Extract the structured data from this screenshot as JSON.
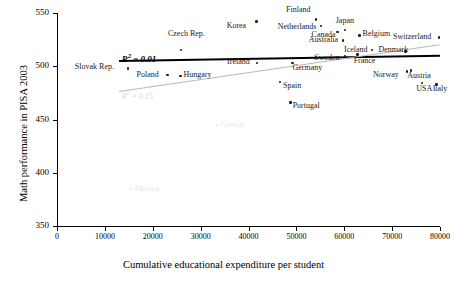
{
  "chart_data": {
    "type": "scatter",
    "title": "",
    "xlabel": "Cumulative educational expenditure per student",
    "ylabel": "Math performance in PISA 2003",
    "xlim": [
      0,
      80000
    ],
    "ylim": [
      350,
      550
    ],
    "xticks": [
      0,
      10000,
      20000,
      30000,
      40000,
      50000,
      60000,
      70000,
      80000
    ],
    "xtick_labels": [
      "0",
      "10000",
      "20000",
      "30000",
      "40000",
      "50000",
      "60000",
      "70000",
      "80000"
    ],
    "yticks": [
      350,
      400,
      450,
      500,
      550
    ],
    "ytick_labels": [
      "350",
      "400",
      "450",
      "500",
      "550"
    ],
    "grid": false,
    "legend": null,
    "points": [
      {
        "name": "Slovak Rep.",
        "x": 14800,
        "y": 498,
        "label_dx": -53,
        "label_dy": -1,
        "faint": false
      },
      {
        "name": "Czech Rep.",
        "x": 25900,
        "y": 515,
        "label_dx": -13,
        "label_dy": -16,
        "faint": false
      },
      {
        "name": "Poland",
        "x": 23100,
        "y": 492,
        "label_dx": -31,
        "label_dy": 0,
        "faint": false
      },
      {
        "name": "Hungary",
        "x": 25800,
        "y": 491,
        "label_dx": 3,
        "label_dy": -1,
        "faint": false
      },
      {
        "name": "Ireland",
        "x": 41800,
        "y": 503,
        "label_dx": -30,
        "label_dy": -1,
        "faint": false
      },
      {
        "name": "Korea",
        "x": 41700,
        "y": 542,
        "label_dx": -30,
        "label_dy": 4,
        "faint": false
      },
      {
        "name": "Spain",
        "x": 46600,
        "y": 485,
        "label_dx": 3,
        "label_dy": 4,
        "faint": false
      },
      {
        "name": "Portugal",
        "x": 48800,
        "y": 466,
        "label_dx": 2,
        "label_dy": 4,
        "faint": false
      },
      {
        "name": "Greece",
        "x": 33400,
        "y": 445,
        "label_dx": 4,
        "label_dy": 0,
        "faint": true
      },
      {
        "name": "Mexico",
        "x": 15400,
        "y": 385,
        "label_dx": 4,
        "label_dy": 0,
        "faint": true
      },
      {
        "name": "Germany",
        "x": 49200,
        "y": 503,
        "label_dx": 0,
        "label_dy": 5,
        "faint": false
      },
      {
        "name": "Finland",
        "x": 54100,
        "y": 544,
        "label_dx": -30,
        "label_dy": -9,
        "faint": false
      },
      {
        "name": "Netherlands",
        "x": 55100,
        "y": 538,
        "label_dx": -43,
        "label_dy": 1,
        "faint": false
      },
      {
        "name": "Canada",
        "x": 58600,
        "y": 532,
        "label_dx": -26,
        "label_dy": 3,
        "faint": false
      },
      {
        "name": "Japan",
        "x": 60100,
        "y": 534,
        "label_dx": -9,
        "label_dy": -9,
        "faint": false
      },
      {
        "name": "Australia",
        "x": 59700,
        "y": 524,
        "label_dx": -34,
        "label_dy": -1,
        "faint": false
      },
      {
        "name": "Sweden",
        "x": 60200,
        "y": 509,
        "label_dx": -31,
        "label_dy": 1,
        "faint": false
      },
      {
        "name": "Belgium",
        "x": 63200,
        "y": 529,
        "label_dx": 3,
        "label_dy": -1,
        "faint": false
      },
      {
        "name": "Iceland",
        "x": 65800,
        "y": 515,
        "label_dx": -28,
        "label_dy": 0,
        "faint": false
      },
      {
        "name": "France",
        "x": 62800,
        "y": 511,
        "label_dx": -4,
        "label_dy": 6,
        "faint": false
      },
      {
        "name": "Switzerland",
        "x": 79800,
        "y": 527,
        "label_dx": -46,
        "label_dy": 0,
        "faint": false
      },
      {
        "name": "Denmark",
        "x": 72800,
        "y": 514,
        "label_dx": -27,
        "label_dy": -1,
        "faint": false
      },
      {
        "name": "Austria",
        "x": 74000,
        "y": 496,
        "label_dx": -4,
        "label_dy": 5,
        "faint": false
      },
      {
        "name": "Norway",
        "x": 73100,
        "y": 495,
        "label_dx": -34,
        "label_dy": 3,
        "faint": false
      },
      {
        "name": "USA",
        "x": 76300,
        "y": 484,
        "label_dx": -6,
        "label_dy": 6,
        "faint": false
      },
      {
        "name": "Italy",
        "x": 79300,
        "y": 483,
        "label_dx": -4,
        "label_dy": 5,
        "faint": false
      }
    ],
    "trendlines": [
      {
        "name": "black-fit",
        "color": "#000000",
        "x0": 13000,
        "y0": 505.5,
        "x1": 80000,
        "y1": 510.5,
        "r2_text": "R 2 = 0.01",
        "r2_value": 0.01
      },
      {
        "name": "gray-fit",
        "color": "#b9b9b9",
        "x0": 13000,
        "y0": 477,
        "x1": 80000,
        "y1": 521,
        "r2_text": "R 2 = 0.15",
        "r2_value": 0.15
      }
    ],
    "annotations": [
      {
        "name": "r2-black-annotation",
        "text_prefix": "R",
        "text_sup": "2",
        "text_suffix": " = 0.01"
      },
      {
        "name": "r2-gray-annotation",
        "text_prefix": "R",
        "text_sup": "2",
        "text_suffix": " = 0.15"
      }
    ]
  }
}
